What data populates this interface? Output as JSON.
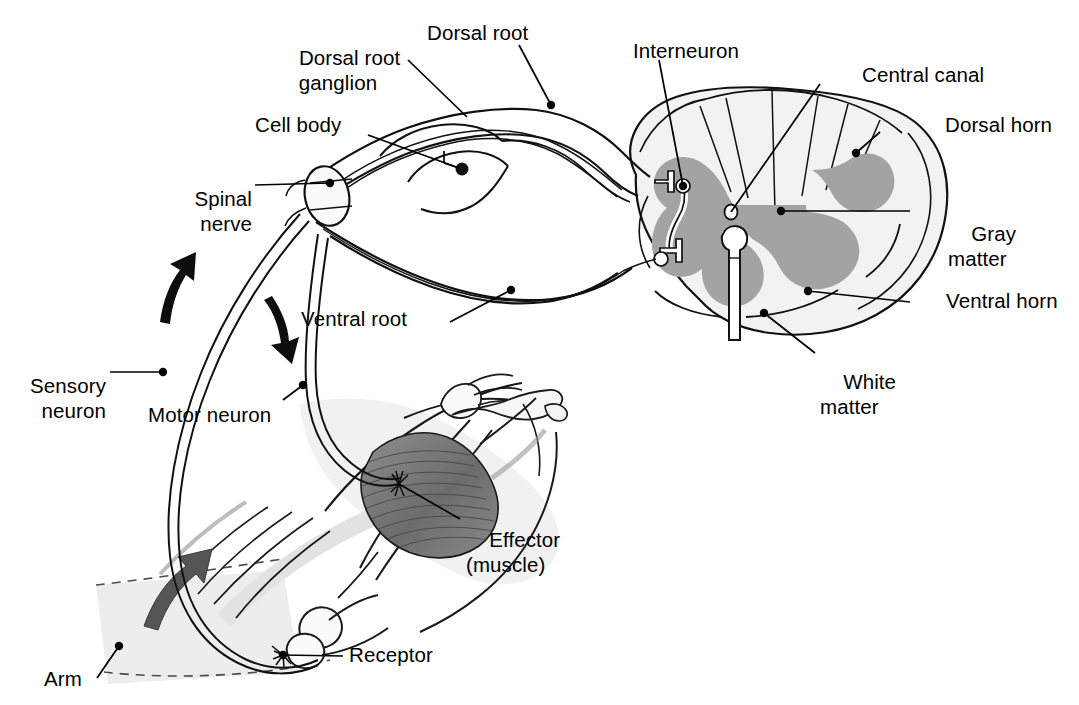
{
  "diagram": {
    "colors": {
      "ink": "#000000",
      "background": "#ffffff",
      "gray_matter": "#a3a3a3",
      "white_matter": "#f0f0f0",
      "nerve_fill": "#f2f2f2",
      "muscle_dark": "#6f6f6f",
      "arm_shadow": "#ededed",
      "arrow": "#1a1a1a"
    }
  },
  "labels": {
    "dorsal_root_ganglion": "Dorsal root\nganglion",
    "dorsal_root": "Dorsal root",
    "interneuron": "Interneuron",
    "central_canal": "Central canal",
    "dorsal_horn": "Dorsal horn",
    "cell_body": "Cell body",
    "gray_matter": "Gray\nmatter",
    "spinal_nerve": "Spinal\nnerve",
    "ventral_horn": "Ventral horn",
    "ventral_root": "Ventral root",
    "white_matter": "White\nmatter",
    "sensory_neuron": "Sensory\nneuron",
    "motor_neuron": "Motor neuron",
    "effector_muscle": "Effector\n(muscle)",
    "receptor": "Receptor",
    "arm": "Arm"
  },
  "label_lines": [
    {
      "name": "dorsal-root-ganglion",
      "from": [
        408,
        60
      ],
      "to": [
        467,
        117
      ]
    },
    {
      "name": "dorsal-root",
      "from": [
        519,
        45
      ],
      "to": [
        551,
        105
      ]
    },
    {
      "name": "interneuron",
      "from": [
        659,
        60
      ],
      "to": [
        683,
        186
      ]
    },
    {
      "name": "central-canal",
      "from": [
        820,
        84
      ],
      "to": [
        731,
        212
      ]
    },
    {
      "name": "dorsal-horn",
      "from": [
        880,
        132
      ],
      "to": [
        856,
        153
      ]
    },
    {
      "name": "cell-body",
      "from": [
        368,
        135
      ],
      "to": [
        459,
        168
      ]
    },
    {
      "name": "gray-matter",
      "from": [
        910,
        211
      ],
      "to": [
        781,
        211
      ]
    },
    {
      "name": "spinal-nerve",
      "from": [
        255,
        185
      ],
      "to": [
        330,
        183
      ]
    },
    {
      "name": "ventral-horn",
      "from": [
        910,
        302
      ],
      "to": [
        808,
        291
      ]
    },
    {
      "name": "ventral-root",
      "from": [
        450,
        322
      ],
      "to": [
        511,
        290
      ]
    },
    {
      "name": "white-matter",
      "from": [
        815,
        353
      ],
      "to": [
        764,
        313
      ]
    },
    {
      "name": "sensory-neuron",
      "from": [
        110,
        372
      ],
      "to": [
        163,
        372
      ]
    },
    {
      "name": "motor-neuron",
      "from": [
        283,
        400
      ],
      "to": [
        303,
        385
      ]
    },
    {
      "name": "effector-muscle",
      "from": [
        460,
        519
      ],
      "to": [
        399,
        484
      ]
    },
    {
      "name": "receptor",
      "from": [
        343,
        656
      ],
      "to": [
        283,
        655
      ]
    },
    {
      "name": "arm",
      "from": [
        97,
        678
      ],
      "to": [
        119,
        646
      ]
    }
  ],
  "anatomy_parts": [
    "spinal cord cross section",
    "gray matter butterfly",
    "white matter",
    "central canal",
    "dorsal horn",
    "ventral horn",
    "dorsal root",
    "dorsal root ganglion",
    "ventral root",
    "spinal nerve",
    "sensory neuron axon",
    "motor neuron axon",
    "interneuron",
    "arm with biceps muscle",
    "stretch receptor at elbow"
  ],
  "flow_arrows": [
    {
      "name": "sensory-direction-arrow",
      "meaning": "afferent signal travels toward spinal cord"
    },
    {
      "name": "motor-direction-arrow",
      "meaning": "efferent signal travels toward muscle"
    },
    {
      "name": "arm-movement-arrow",
      "meaning": "arm flexes upward"
    }
  ]
}
